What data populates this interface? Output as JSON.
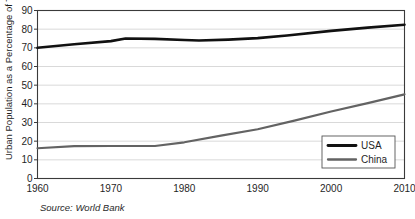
{
  "chart_data": {
    "type": "line",
    "title": "",
    "xlabel": "",
    "ylabel": "Urban Population as a Percentage of Total",
    "xlim": [
      1960,
      2010
    ],
    "ylim": [
      0,
      90
    ],
    "grid": true,
    "legend_position": "bottom-right",
    "x_ticks": [
      "1960",
      "1970",
      "1980",
      "1990",
      "2000",
      "2010"
    ],
    "x_tick_values": [
      1960,
      1970,
      1980,
      1990,
      2000,
      2010
    ],
    "y_ticks": [
      "0",
      "10",
      "20",
      "30",
      "40",
      "50",
      "60",
      "70",
      "80",
      "90"
    ],
    "y_tick_values": [
      0,
      10,
      20,
      30,
      40,
      50,
      60,
      70,
      80,
      90
    ],
    "source": "Source: World Bank",
    "series": [
      {
        "name": "USA",
        "color": "#111111",
        "x": [
          1960,
          1965,
          1970,
          1972,
          1976,
          1980,
          1982,
          1986,
          1990,
          1994,
          2000,
          2005,
          2010
        ],
        "values": [
          70.0,
          71.9,
          73.6,
          75.0,
          74.8,
          74.2,
          73.9,
          74.4,
          75.2,
          76.6,
          79.1,
          80.8,
          82.4
        ]
      },
      {
        "name": "China",
        "color": "#636363",
        "x": [
          1960,
          1965,
          1970,
          1976,
          1980,
          1985,
          1990,
          1995,
          2000,
          2005,
          2010
        ],
        "values": [
          16.2,
          17.3,
          17.4,
          17.4,
          19.4,
          23.0,
          26.4,
          31.0,
          35.9,
          40.4,
          45.1
        ]
      }
    ]
  },
  "legend": {
    "items": [
      {
        "label": "USA"
      },
      {
        "label": "China"
      }
    ]
  }
}
